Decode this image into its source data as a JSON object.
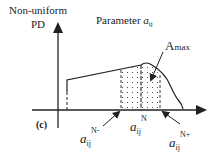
{
  "diagram": {
    "panel_label": "(c)",
    "y_axis_label_line1": "Non-uniform",
    "y_axis_label_line2": "PD",
    "title_prefix": "Parameter ",
    "title_var": "a",
    "title_sub": "ij",
    "annotation_peak": "A",
    "annotation_peak_sub": "max",
    "x_markers": {
      "lower": {
        "var": "a",
        "sub": "ij",
        "sup": "N-"
      },
      "center": {
        "var": "a",
        "sub": "ij",
        "sup": "N"
      },
      "upper": {
        "var": "a",
        "sub": "ij",
        "sup": "N+"
      }
    },
    "colors": {
      "line": "#222222",
      "background": "#ffffff"
    }
  }
}
